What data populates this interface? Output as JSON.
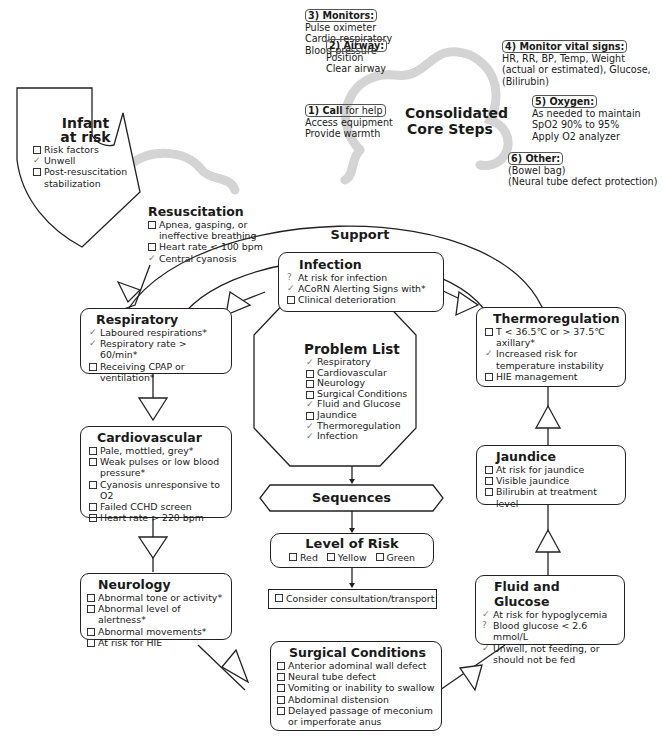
{
  "core_steps": {
    "title": "Consolidated Core Steps",
    "step1": {
      "label_bold": "1) Call",
      "label_rest": " for help",
      "lines": [
        "Access equipment",
        "Provide warmth"
      ]
    },
    "step2": {
      "label": "2) Airway:",
      "lines": [
        "Position",
        "Clear airway"
      ]
    },
    "step3": {
      "label": "3) Monitors:",
      "lines": [
        "Pulse oximeter",
        "Cardio-respiratory",
        "Blood pressure"
      ]
    },
    "step4": {
      "label": "4) Monitor vital signs:",
      "lines": [
        "HR, RR, BP, Temp, Weight",
        "(actual or estimated), Glucose,",
        "(Bilirubin)"
      ]
    },
    "step5": {
      "label": "5) Oxygen:",
      "lines": [
        "As needed to maintain",
        "SpO2 90% to 95%",
        "Apply O2 analyzer"
      ]
    },
    "step6": {
      "label": "6) Other:",
      "lines": [
        "(Bowel bag)",
        "(Neural tube defect protection)"
      ]
    }
  },
  "infant_at_risk": {
    "title_line1": "Infant",
    "title_line2": "at risk",
    "items": [
      {
        "mark": "box",
        "text": "Risk factors"
      },
      {
        "mark": "check",
        "text": "Unwell"
      },
      {
        "mark": "box",
        "text": "Post-resuscitation stabilization"
      }
    ]
  },
  "resuscitation": {
    "title": "Resuscitation",
    "items": [
      {
        "mark": "box",
        "text": "Apnea, gasping, or ineffective breathing"
      },
      {
        "mark": "box",
        "text": "Heart rate < 100 bpm"
      },
      {
        "mark": "check",
        "text": "Central cyanosis"
      }
    ]
  },
  "support_label": "Support",
  "infection": {
    "title": "Infection",
    "items": [
      {
        "mark": "question",
        "text": "At risk for infection"
      },
      {
        "mark": "check",
        "text": "ACoRN Alerting Signs with*"
      },
      {
        "mark": "box",
        "text": "Clinical deterioration"
      }
    ]
  },
  "respiratory": {
    "title": "Respiratory",
    "items": [
      {
        "mark": "check",
        "text": "Laboured respirations*"
      },
      {
        "mark": "check",
        "text": "Respiratory rate > 60/min*"
      },
      {
        "mark": "box",
        "text": "Receiving CPAP or ventilation*"
      }
    ]
  },
  "thermoregulation": {
    "title": "Thermoregulation",
    "items": [
      {
        "mark": "box",
        "text": "T < 36.5℃ or > 37.5℃ axillary*"
      },
      {
        "mark": "check",
        "text": "Increased risk for temperature instability"
      },
      {
        "mark": "box",
        "text": "HIE management"
      }
    ]
  },
  "problem_list": {
    "title": "Problem List",
    "items": [
      {
        "mark": "check",
        "text": "Respiratory"
      },
      {
        "mark": "box",
        "text": "Cardiovascular"
      },
      {
        "mark": "box",
        "text": "Neurology"
      },
      {
        "mark": "box",
        "text": "Surgical Conditions"
      },
      {
        "mark": "check",
        "text": "Fluid and Glucose"
      },
      {
        "mark": "box",
        "text": "Jaundice"
      },
      {
        "mark": "check",
        "text": "Thermoregulation"
      },
      {
        "mark": "check",
        "text": "Infection"
      }
    ]
  },
  "cardiovascular": {
    "title": "Cardiovascular",
    "items": [
      {
        "mark": "box",
        "text": "Pale, mottled, grey*"
      },
      {
        "mark": "box",
        "text": "Weak pulses or low blood pressure*"
      },
      {
        "mark": "box",
        "text": "Cyanosis unresponsive to O2"
      },
      {
        "mark": "box",
        "text": "Failed CCHD screen"
      },
      {
        "mark": "box",
        "text": "Heart rate > 220 bpm"
      }
    ]
  },
  "sequences_label": "Sequences",
  "level_of_risk": {
    "title": "Level of Risk",
    "options": [
      "Red",
      "Yellow",
      "Green"
    ]
  },
  "consider": {
    "text": "Consider consultation/transport"
  },
  "jaundice": {
    "title": "Jaundice",
    "items": [
      {
        "mark": "box",
        "text": "At risk for jaundice"
      },
      {
        "mark": "box",
        "text": "Visible jaundice"
      },
      {
        "mark": "box",
        "text": "Bilirubin at treatment level"
      }
    ]
  },
  "neurology": {
    "title": "Neurology",
    "items": [
      {
        "mark": "box",
        "text": "Abnormal tone or activity*"
      },
      {
        "mark": "box",
        "text": "Abnormal level of alertness*"
      },
      {
        "mark": "box",
        "text": "Abnormal movements*"
      },
      {
        "mark": "box",
        "text": "At risk for HIE"
      }
    ]
  },
  "fluid_glucose": {
    "title": "Fluid and Glucose",
    "items": [
      {
        "mark": "check",
        "text": "At risk for hypoglycemia"
      },
      {
        "mark": "question",
        "text": "Blood glucose < 2.6 mmol/L"
      },
      {
        "mark": "check",
        "text": "Unwell, not feeding, or should not be fed"
      }
    ]
  },
  "surgical": {
    "title": "Surgical Conditions",
    "items": [
      {
        "mark": "box",
        "text": "Anterior adominal wall defect"
      },
      {
        "mark": "box",
        "text": "Neural tube defect"
      },
      {
        "mark": "box",
        "text": "Vomiting or inability to swallow"
      },
      {
        "mark": "box",
        "text": "Abdominal distension"
      },
      {
        "mark": "box",
        "text": "Delayed passage of meconium or imperforate anus"
      }
    ]
  },
  "marks": {
    "check": "✓",
    "question": "?"
  }
}
